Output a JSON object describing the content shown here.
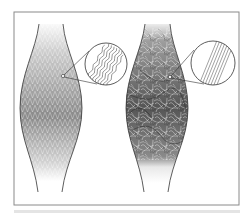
{
  "figure": {
    "frame": {
      "x": 14,
      "y": 12,
      "width": 225,
      "height": 193,
      "stroke": "#8a8a8a"
    },
    "left_tissue": {
      "label": "organized-crimped-fibers",
      "fill_pattern": "regular crosshatch",
      "gradient": [
        "#d8d8d8",
        "#7a7a7a",
        "#ffffff"
      ],
      "inset": {
        "cx": 106,
        "cy": 64,
        "r": 21,
        "content": "wavy parallel fibers"
      },
      "pointer": {
        "x": 63,
        "y": 76
      }
    },
    "right_tissue": {
      "label": "disorganized-fibers",
      "fill_pattern": "random meshwork",
      "gradient": [
        "#cfcfcf",
        "#3a3a3a",
        "#ffffff"
      ],
      "inset": {
        "cx": 213,
        "cy": 63,
        "r": 22,
        "content": "straight parallel fibers"
      },
      "pointer": {
        "x": 170,
        "y": 77
      }
    },
    "outline_color": "#333333"
  },
  "caption": {
    "text": ""
  }
}
